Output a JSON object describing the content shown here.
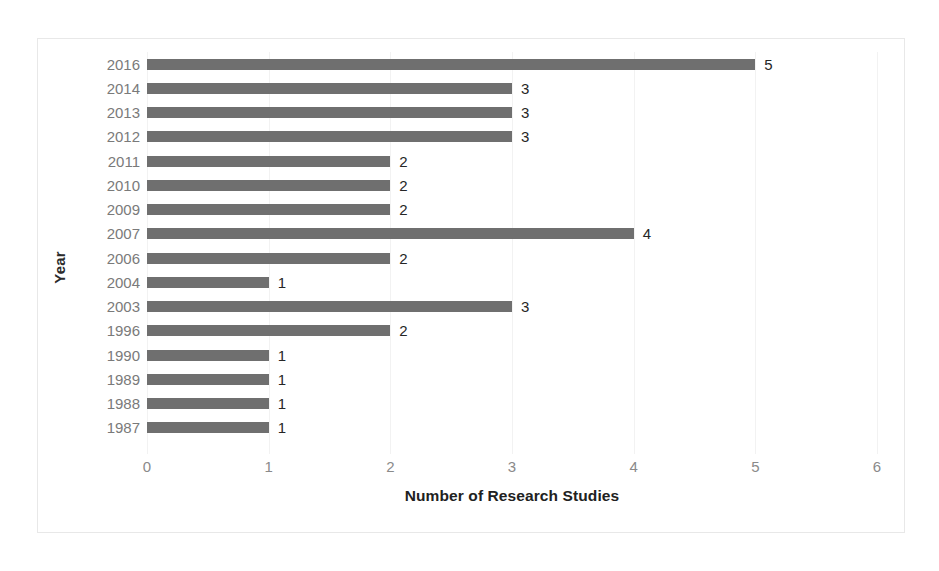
{
  "chart_data": {
    "type": "bar",
    "orientation": "horizontal",
    "title": "",
    "xlabel": "Number of Research Studies",
    "ylabel": "Year",
    "categories": [
      "2016",
      "2014",
      "2013",
      "2012",
      "2011",
      "2010",
      "2009",
      "2007",
      "2006",
      "2004",
      "2003",
      "1996",
      "1990",
      "1989",
      "1988",
      "1987"
    ],
    "values": [
      5,
      3,
      3,
      3,
      2,
      2,
      2,
      4,
      2,
      1,
      3,
      2,
      1,
      1,
      1,
      1
    ],
    "data_labels": [
      "5",
      "3",
      "3",
      "3",
      "2",
      "2",
      "2",
      "4",
      "2",
      "1",
      "3",
      "2",
      "1",
      "1",
      "1",
      "1"
    ],
    "xlim": [
      0,
      6
    ],
    "xticks": [
      0,
      1,
      2,
      3,
      4,
      5,
      6
    ],
    "xtick_labels": [
      "0",
      "1",
      "2",
      "3",
      "4",
      "5",
      "6"
    ],
    "grid": "vertical",
    "legend": "none",
    "bar_color": "#6f6f6f",
    "plot_background": "#ffffff",
    "frame_color": "#e8e8e8",
    "tick_label_color": "#7a7a7a",
    "axis_title_color": "#212121"
  }
}
